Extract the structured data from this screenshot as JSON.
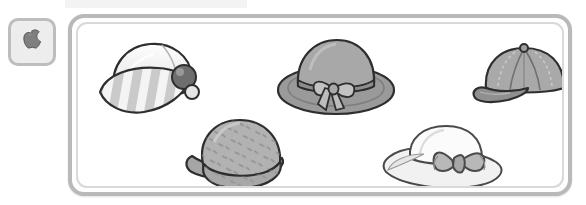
{
  "window": {
    "background_color": "#ffffff",
    "top_strip_color": "#f3f3f3"
  },
  "toolbar": {
    "button": {
      "name": "apple-tool-button",
      "icon": "apple-icon",
      "label": "",
      "border_color": "#bdbdbd",
      "fill_color": "#efefef",
      "icon_color": "#8c8c8c"
    }
  },
  "panel": {
    "name": "hats-gallery-panel",
    "border_color": "#b9b9b9",
    "inner_border_color": "#d9d9d9",
    "background_color": "#ffffff",
    "title": ""
  },
  "items": [
    {
      "id": "hat-1",
      "name": "striped-brim-cap",
      "label": "",
      "colors": {
        "crown": "#f2f2f2",
        "brim_light": "#f4f4f4",
        "brim_dark": "#c9c9c9",
        "button": "#6e6e6e",
        "outline": "#2e2e2e"
      },
      "position": {
        "x": 88,
        "y": 26,
        "width": 110,
        "height": 86
      }
    },
    {
      "id": "hat-2",
      "name": "wide-brim-sun-hat-with-bow",
      "label": "",
      "colors": {
        "crown": "#a8a8a8",
        "brim": "#9a9a9a",
        "band": "#8e8e8e",
        "bow": "#bcbcbc",
        "outline": "#2e2e2e"
      },
      "position": {
        "x": 272,
        "y": 24,
        "width": 118,
        "height": 78
      }
    },
    {
      "id": "hat-3",
      "name": "baseball-cap",
      "label": "",
      "colors": {
        "crown": "#a9a9a9",
        "panel_alt": "#9b9b9b",
        "visor": "#8f8f8f",
        "outline": "#2e2e2e"
      },
      "position": {
        "x": 466,
        "y": 34,
        "width": 98,
        "height": 64
      }
    },
    {
      "id": "hat-4",
      "name": "dotted-cloche-hat",
      "label": "",
      "colors": {
        "crown": "#b2b2b2",
        "brim": "#a5a5a5",
        "dots": "#8a8a8a",
        "outline": "#2e2e2e"
      },
      "position": {
        "x": 176,
        "y": 100,
        "width": 112,
        "height": 80
      }
    },
    {
      "id": "hat-5",
      "name": "white-hat-with-large-bow",
      "label": "",
      "colors": {
        "crown": "#fbfbfb",
        "brim": "#f0f0f0",
        "bow": "#b8b8b8",
        "outline": "#4a4a4a"
      },
      "position": {
        "x": 374,
        "y": 104,
        "width": 128,
        "height": 76
      }
    }
  ]
}
